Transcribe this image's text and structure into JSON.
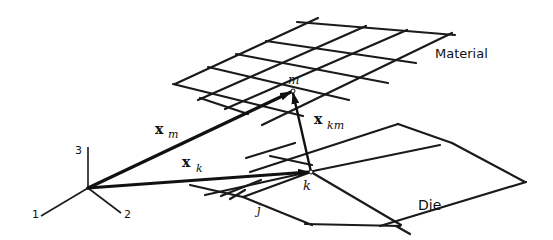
{
  "figure": {
    "labels": {
      "material": "Material",
      "die": "Die",
      "axis_1": "1",
      "axis_2": "2",
      "axis_3": "3",
      "node_m": "m",
      "node_k": "k",
      "node_j": "j"
    },
    "vectors": {
      "x_m": {
        "symbol": "x",
        "subscript": "m"
      },
      "x_k": {
        "symbol": "x",
        "subscript": "k"
      },
      "x_km": {
        "symbol": "x",
        "subscript": "km"
      }
    },
    "colors": {
      "ink": "#111111",
      "background": "#ffffff"
    }
  }
}
